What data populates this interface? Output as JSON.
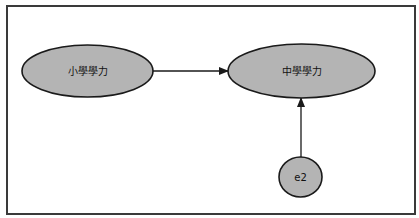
{
  "diagram": {
    "type": "path-diagram",
    "colors": {
      "node_fill": "#b4b4b4",
      "node_stroke": "#1a1a1a",
      "edge": "#1a1a1a",
      "frame": "#3a3a3a",
      "background": "#ffffff"
    },
    "nodes": [
      {
        "id": "elementary",
        "label": "小學學力",
        "shape": "ellipse",
        "cx": 87.5,
        "cy": 71,
        "rx": 65.5,
        "ry": 26
      },
      {
        "id": "middle",
        "label": "中學學力",
        "shape": "ellipse",
        "cx": 301.5,
        "cy": 71,
        "rx": 73.5,
        "ry": 27
      },
      {
        "id": "e2",
        "label": "e2",
        "shape": "ellipse",
        "cx": 300.5,
        "cy": 177,
        "rx": 21.5,
        "ry": 20
      }
    ],
    "edges": [
      {
        "from": "elementary",
        "to": "middle",
        "directed": true
      },
      {
        "from": "e2",
        "to": "middle",
        "directed": true
      }
    ]
  }
}
